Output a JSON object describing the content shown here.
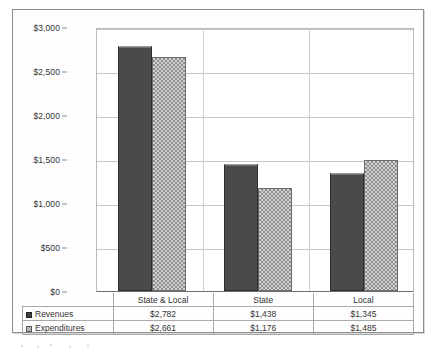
{
  "chart_data": {
    "type": "bar",
    "title": "",
    "xlabel": "",
    "ylabel": "",
    "ylim": [
      0,
      3000
    ],
    "ytick_values": [
      0,
      500,
      1000,
      1500,
      2000,
      2500,
      3000
    ],
    "ytick_labels": [
      "$0",
      "$500",
      "$1,000",
      "$1,500",
      "$2,000",
      "$2,500",
      "$3,000"
    ],
    "categories": [
      "State & Local",
      "State",
      "Local"
    ],
    "grid": true,
    "legend_position": "bottom-table",
    "series": [
      {
        "name": "Revenues",
        "values": [
          2782,
          1438,
          1345
        ],
        "value_labels": [
          "$2,782",
          "$1,438",
          "$1,345"
        ],
        "color": "#4a4a4a",
        "fill": "solid"
      },
      {
        "name": "Expenditures",
        "values": [
          2661,
          1176,
          1485
        ],
        "value_labels": [
          "$2,661",
          "$1,176",
          "$1,485"
        ],
        "color": "#d2d2d2",
        "fill": "checkered-hatch"
      }
    ]
  },
  "table": {
    "corner_label": "",
    "column_headers": [
      "State & Local",
      "State",
      "Local"
    ],
    "rows": [
      {
        "label": "Revenues",
        "marker": "solid-square-icon",
        "cells": [
          "$2,782",
          "$1,438",
          "$1,345"
        ]
      },
      {
        "label": "Expenditures",
        "marker": "hatched-square-icon",
        "cells": [
          "$2,661",
          "$1,176",
          "$1,485"
        ]
      }
    ]
  },
  "colors": {
    "revenues": "#4a4a4a",
    "expenditures": "#d2d2d2",
    "gridline": "#c6c6c6",
    "frame": "#8d8d8d"
  }
}
